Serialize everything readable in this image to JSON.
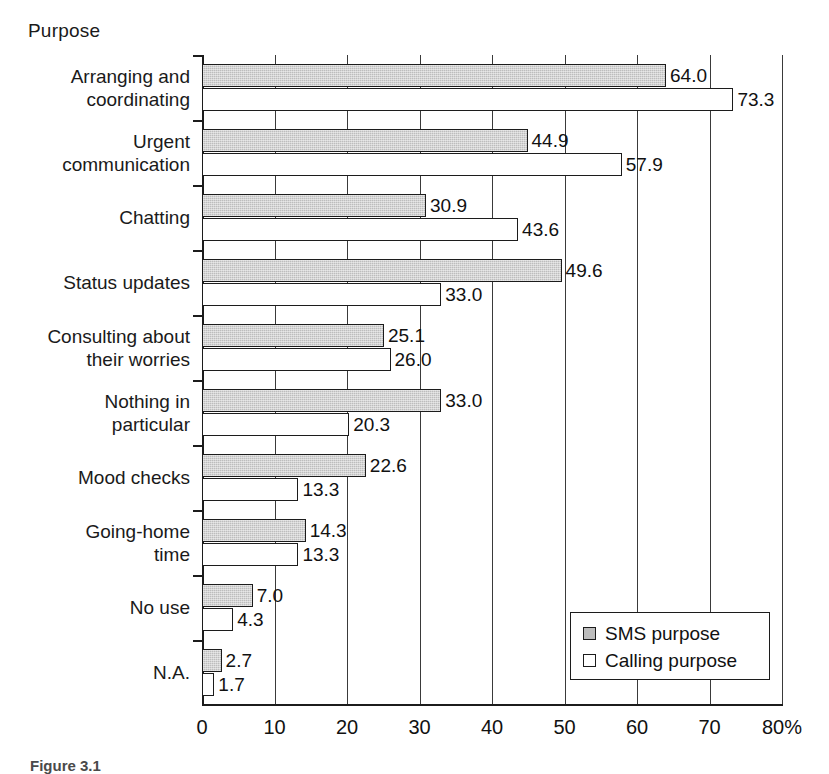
{
  "axis_title": "Purpose",
  "caption": "Figure 3.1",
  "legend": {
    "position": "bottom-right",
    "items": [
      {
        "label": "SMS purpose",
        "key": "sms",
        "color": "#bdbdbd"
      },
      {
        "label": "Calling purpose",
        "key": "calling",
        "color": "#ffffff"
      }
    ]
  },
  "xaxis": {
    "ticks": [
      "0",
      "10",
      "20",
      "30",
      "40",
      "50",
      "60",
      "70",
      "80%"
    ],
    "min": 0,
    "max": 80,
    "step": 10
  },
  "chart_data": {
    "type": "bar",
    "orientation": "horizontal",
    "title": "Purpose",
    "xlabel": "%",
    "ylabel": "Purpose",
    "xlim": [
      0,
      80
    ],
    "xticks": [
      0,
      10,
      20,
      30,
      40,
      50,
      60,
      70,
      80
    ],
    "grid": true,
    "legend_position": "bottom-right",
    "categories": [
      "Arranging and\ncoordinating",
      "Urgent\ncommunication",
      "Chatting",
      "Status updates",
      "Consulting about\ntheir worries",
      "Nothing in\nparticular",
      "Mood checks",
      "Going-home\ntime",
      "No use",
      "N.A."
    ],
    "series": [
      {
        "name": "SMS purpose",
        "color": "#bdbdbd",
        "values": [
          64.0,
          44.9,
          30.9,
          49.6,
          25.1,
          33.0,
          22.6,
          14.3,
          7.0,
          2.7
        ],
        "labels": [
          "64.0",
          "44.9",
          "30.9",
          "49.6",
          "25.1",
          "33.0",
          "22.6",
          "14.3",
          "7.0",
          "2.7"
        ]
      },
      {
        "name": "Calling purpose",
        "color": "#ffffff",
        "values": [
          73.3,
          57.9,
          43.6,
          33.0,
          26.0,
          20.3,
          13.3,
          13.3,
          4.3,
          1.7
        ],
        "labels": [
          "73.3",
          "57.9",
          "43.6",
          "33.0",
          "26.0",
          "20.3",
          "13.3",
          "13.3",
          "4.3",
          "1.7"
        ]
      }
    ]
  }
}
